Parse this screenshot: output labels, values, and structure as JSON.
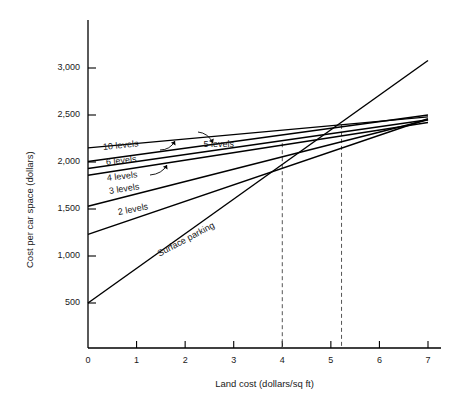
{
  "chart_data": {
    "type": "line",
    "title": "",
    "xlabel": "Land cost (dollars/sq ft)",
    "ylabel": "Cost per car space (dollars)",
    "xlim": [
      0,
      7
    ],
    "ylim": [
      250,
      3250
    ],
    "grid": false,
    "legend_position": "inline-labels",
    "xticks": [
      "0",
      "1",
      "2",
      "3",
      "4",
      "5",
      "6",
      "7"
    ],
    "xtick_values": [
      0,
      1,
      2,
      3,
      4,
      5,
      6,
      7
    ],
    "yticks": [
      "500",
      "1,000",
      "1,500",
      "2,000",
      "2,500",
      "3,000"
    ],
    "ytick_values": [
      500,
      1000,
      1500,
      2000,
      2500,
      3000
    ],
    "series": [
      {
        "name": "Surface parking",
        "x": [
          0,
          7
        ],
        "values": [
          500,
          3080
        ],
        "label_x": 1.45,
        "label_y": 1075,
        "label_rotate": -28,
        "leader": false
      },
      {
        "name": "2 levels",
        "x": [
          0,
          7
        ],
        "values": [
          1230,
          2460
        ],
        "label_x": 0.62,
        "label_y": 1520,
        "label_rotate": -11,
        "leader": false
      },
      {
        "name": "3 levels",
        "x": [
          0,
          7
        ],
        "values": [
          1530,
          2450
        ],
        "label_x": 0.44,
        "label_y": 1745,
        "label_rotate": -9,
        "leader": false
      },
      {
        "name": "4 levels",
        "x": [
          0,
          7
        ],
        "values": [
          1860,
          2420
        ],
        "label_x": 0.4,
        "label_y": 1885,
        "label_rotate": -7,
        "leader": true
      },
      {
        "name": "6 levels",
        "x": [
          0,
          7
        ],
        "values": [
          1930,
          2450
        ],
        "label_x": 0.38,
        "label_y": 2055,
        "label_rotate": -6,
        "leader": true
      },
      {
        "name": "10 levels",
        "x": [
          0,
          7
        ],
        "values": [
          2005,
          2500
        ],
        "label_x": 0.3,
        "label_y": 2215,
        "label_rotate": -6,
        "leader": false
      },
      {
        "name": "5 levels",
        "x": [
          0,
          7
        ],
        "values": [
          2150,
          2480
        ],
        "label_x": 2.38,
        "label_y": 2250,
        "label_rotate": 0,
        "leader": true
      }
    ],
    "annotations": [
      {
        "name": "breakeven-marker-1",
        "type": "vline-dashed",
        "x": 4.0,
        "y_top": 2200
      },
      {
        "name": "breakeven-marker-2",
        "type": "vline-dashed",
        "x": 5.22,
        "y_top": 2395
      }
    ]
  }
}
